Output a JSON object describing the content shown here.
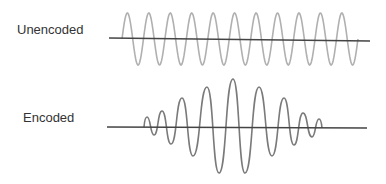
{
  "labels": {
    "unencoded": "Unencoded",
    "encoded": "Encoded"
  },
  "colors": {
    "background": "#ffffff",
    "text": "#333333",
    "axis": "#444444",
    "unencoded_wave": "#b0b0b0",
    "encoded_wave": "#7a7a7a"
  },
  "chart_data": [
    {
      "type": "line",
      "title": "Unencoded",
      "description": "Constant-amplitude sinusoid",
      "baseline": {
        "x1": 109,
        "y1": 38,
        "x2": 370,
        "y2": 41
      },
      "wave": {
        "start_x": 122,
        "center_y": 39,
        "amplitude": 26,
        "period": 21.45,
        "cycles": 11
      }
    },
    {
      "type": "line",
      "title": "Encoded",
      "description": "Amplitude-modulated sinusoid (pulse envelope, peak at center)",
      "baseline": {
        "x1": 107,
        "y1": 127,
        "x2": 367,
        "y2": 128
      },
      "points": [
        [
          144,
          127
        ],
        [
          147,
          117
        ],
        [
          154,
          135
        ],
        [
          162,
          111
        ],
        [
          171,
          144
        ],
        [
          182,
          98
        ],
        [
          193,
          156
        ],
        [
          207,
          87
        ],
        [
          219,
          173
        ],
        [
          233,
          79
        ],
        [
          245,
          173
        ],
        [
          259,
          87
        ],
        [
          272,
          156
        ],
        [
          284,
          98
        ],
        [
          294,
          145
        ],
        [
          303,
          113
        ],
        [
          312,
          137
        ],
        [
          319,
          119
        ],
        [
          322,
          128
        ]
      ]
    }
  ]
}
